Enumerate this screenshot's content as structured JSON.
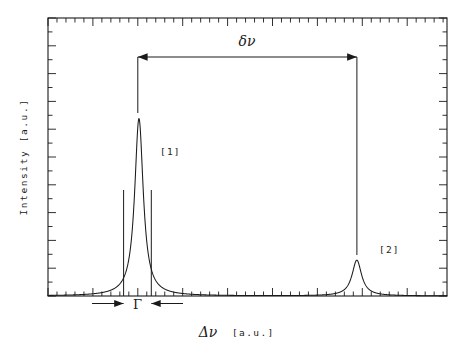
{
  "figure": {
    "background_color": "#ffffff",
    "ink_color": "#1a1a1a",
    "frame": {
      "left": 48,
      "top": 18,
      "right": 447,
      "bottom": 296
    }
  },
  "axes": {
    "y_label": "Intensity [a.u.]",
    "x_label_symbol": "Δν",
    "x_label_units": "[a.u.]",
    "tick_direction": "inward",
    "frame_sides": [
      "top",
      "right",
      "bottom",
      "left"
    ]
  },
  "annotations": {
    "separation": {
      "symbol": "δν",
      "name": "frequency-separation",
      "arrow_style": "double-headed",
      "from_peak": "[1]",
      "to_peak": "[2]"
    },
    "linewidth": {
      "symbol": "Γ",
      "name": "linewidth-fwhm",
      "arrow_style": "inward-pair",
      "applies_to_peak": "[1]"
    },
    "peak_tags": [
      {
        "label": "[1]",
        "peak_index": 0
      },
      {
        "label": "[2]",
        "peak_index": 1
      }
    ]
  },
  "chart_data": {
    "type": "line",
    "title": "",
    "subtitle": "",
    "xlabel": "Δν [a.u.]",
    "ylabel": "Intensity [a.u.]",
    "xlim": [
      0,
      100
    ],
    "ylim": [
      0,
      1.05
    ],
    "grid": false,
    "legend": null,
    "lineshape": "lorentzian",
    "series": [
      {
        "name": "spectrum",
        "comment": "Sum of two Lorentzian lines plotted in arbitrary units",
        "peaks": [
          {
            "label": "[1]",
            "center_x": 22.8,
            "amplitude": 0.67,
            "hwhm": 1.3,
            "fwhm": 2.6
          },
          {
            "label": "[2]",
            "center_x": 77.4,
            "amplitude": 0.135,
            "hwhm": 1.45,
            "fwhm": 2.9
          }
        ]
      }
    ],
    "measurements": [
      {
        "symbol": "δν",
        "description": "separation between line [1] and line [2]",
        "x_start": 22.8,
        "x_end": 77.4,
        "value": 54.6
      },
      {
        "symbol": "Γ",
        "description": "full width at half maximum of line [1]",
        "x_start": 19.1,
        "x_end": 26.1,
        "value": 7.0
      }
    ],
    "axis_ticks": {
      "x_major_count": 9,
      "x_minor_per_major": 5,
      "y_major_count": 7,
      "y_minor_per_major": 2,
      "tick_labels_shown": false
    }
  }
}
